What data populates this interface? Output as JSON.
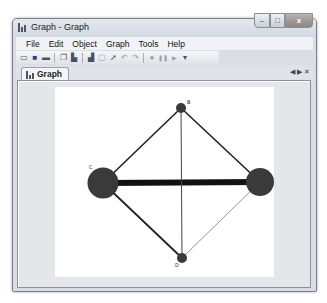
{
  "window": {
    "title": "Graph - Graph",
    "controls": {
      "minimize": "–",
      "maximize": "□",
      "close": "x"
    }
  },
  "menu": {
    "items": [
      {
        "label": "File"
      },
      {
        "label": "Edit"
      },
      {
        "label": "Object"
      },
      {
        "label": "Graph"
      },
      {
        "label": "Tools"
      },
      {
        "label": "Help"
      }
    ]
  },
  "toolbar": {
    "buttons": [
      {
        "icon": "open-folder-icon",
        "glyph": "▭"
      },
      {
        "icon": "save-icon",
        "glyph": "■"
      },
      {
        "icon": "print-icon",
        "glyph": "▬"
      },
      {
        "icon": "copy-icon",
        "glyph": "❐"
      },
      {
        "icon": "paste-icon",
        "glyph": "▙"
      },
      {
        "icon": "chart-icon",
        "glyph": "▟"
      },
      {
        "icon": "select-icon",
        "glyph": "▢"
      },
      {
        "icon": "pointer-icon",
        "glyph": "➚"
      },
      {
        "icon": "undo-icon",
        "glyph": "↶"
      },
      {
        "icon": "redo-icon",
        "glyph": "↷"
      },
      {
        "icon": "record-icon",
        "glyph": "●"
      },
      {
        "icon": "pause-icon",
        "glyph": "❚❚"
      },
      {
        "icon": "play-icon",
        "glyph": "▶"
      },
      {
        "icon": "overflow-dropdown-icon",
        "glyph": "▾"
      }
    ]
  },
  "tabs": [
    {
      "label": "Graph",
      "active": true
    }
  ],
  "tab_controls": {
    "prev": "◀",
    "next": "▶",
    "close": "✕"
  },
  "graph": {
    "nodes": [
      {
        "id": "A",
        "label": "A",
        "x": 205,
        "y": 95,
        "r": 14
      },
      {
        "id": "B",
        "label": "B",
        "x": 126,
        "y": 21,
        "r": 5
      },
      {
        "id": "C",
        "label": "C",
        "x": 48,
        "y": 96,
        "r": 15.5
      },
      {
        "id": "D",
        "label": "D",
        "x": 127,
        "y": 171,
        "r": 5
      }
    ],
    "edges": [
      {
        "from": "C",
        "to": "A",
        "width": 6,
        "color": "#111111"
      },
      {
        "from": "C",
        "to": "B",
        "width": 1.6,
        "color": "#222222"
      },
      {
        "from": "B",
        "to": "A",
        "width": 1.6,
        "color": "#222222"
      },
      {
        "from": "C",
        "to": "D",
        "width": 1.8,
        "color": "#222222"
      },
      {
        "from": "B",
        "to": "D",
        "width": 1,
        "color": "#444444"
      },
      {
        "from": "A",
        "to": "D",
        "width": 0.8,
        "color": "#777777"
      }
    ],
    "node_color": "#3a3a3a"
  }
}
